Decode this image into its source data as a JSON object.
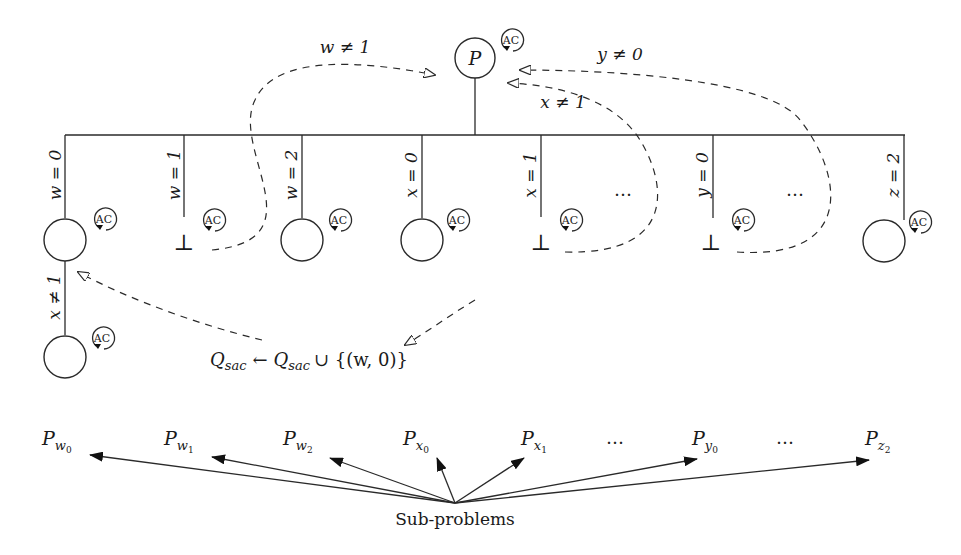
{
  "diagram": {
    "root": {
      "label": "P",
      "badge": "AC"
    },
    "branch_labels": [
      "w = 0",
      "w = 1",
      "w = 2",
      "x = 0",
      "x = 1",
      "y = 0",
      "z = 2"
    ],
    "branch_ellipses": [
      "…",
      "…"
    ],
    "branches": [
      {
        "label": "w = 0",
        "outcome": "node",
        "badge": "AC"
      },
      {
        "label": "w = 1",
        "outcome": "bottom",
        "outcome_symbol": "⊥",
        "badge": "AC"
      },
      {
        "label": "w = 2",
        "outcome": "node",
        "badge": "AC"
      },
      {
        "label": "x = 0",
        "outcome": "node",
        "badge": "AC"
      },
      {
        "label": "x = 1",
        "outcome": "bottom",
        "outcome_symbol": "⊥",
        "badge": "AC"
      },
      {
        "label": "y = 0",
        "outcome": "bottom",
        "outcome_symbol": "⊥",
        "badge": "AC"
      },
      {
        "label": "z = 2",
        "outcome": "node",
        "badge": "AC"
      }
    ],
    "second_level": {
      "label": "x ≠ 1",
      "badge": "AC"
    },
    "refutations": [
      {
        "label": "w ≠ 1",
        "from": "w = 1",
        "to": "P"
      },
      {
        "label": "x ≠ 1",
        "from": "x = 1",
        "to": "P"
      },
      {
        "label": "y ≠ 0",
        "from": "y = 0",
        "to": "P"
      }
    ],
    "queue_update": {
      "lhs": "Q",
      "lhs_sub": "sac",
      "arrow": "←",
      "rhs": "Q",
      "rhs_sub": "sac",
      "union": "∪ {(w, 0)}"
    },
    "bottom_symbol": "⊥",
    "sub_problems": {
      "caption": "Sub-problems",
      "items": [
        {
          "base": "P",
          "sub": "w",
          "subsub": "0"
        },
        {
          "base": "P",
          "sub": "w",
          "subsub": "1"
        },
        {
          "base": "P",
          "sub": "w",
          "subsub": "2"
        },
        {
          "base": "P",
          "sub": "x",
          "subsub": "0"
        },
        {
          "base": "P",
          "sub": "x",
          "subsub": "1"
        },
        {
          "base": "P",
          "sub": "y",
          "subsub": "0"
        },
        {
          "base": "P",
          "sub": "z",
          "subsub": "2"
        }
      ],
      "ellipses": [
        "…",
        "…"
      ]
    }
  }
}
